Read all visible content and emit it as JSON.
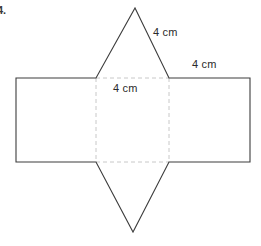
{
  "figure": {
    "item_number": "4.",
    "labels": {
      "slant_edge": "4 cm",
      "top_edge": "4 cm",
      "center_face": "4 cm"
    },
    "colors": {
      "solid_stroke": "#3c3c3c",
      "dashed_stroke": "#c8c8c8",
      "fill": "#ffffff",
      "text": "#2b2b2b",
      "background": "#ffffff"
    },
    "geometry": {
      "canvas": {
        "width": 261,
        "height": 246
      },
      "outer_rectangle": {
        "left": 16,
        "right": 250,
        "top": 78,
        "bottom": 162
      },
      "center_square": {
        "left": 96,
        "right": 169,
        "top": 78,
        "bottom": 162
      },
      "top_triangle": {
        "base_left_x": 96,
        "base_right_x": 169,
        "base_y": 78,
        "apex_x": 135,
        "apex_y": 8
      },
      "bottom_triangle": {
        "base_left_x": 96,
        "base_right_x": 169,
        "base_y": 162,
        "apex_x": 133,
        "apex_y": 232
      }
    }
  }
}
